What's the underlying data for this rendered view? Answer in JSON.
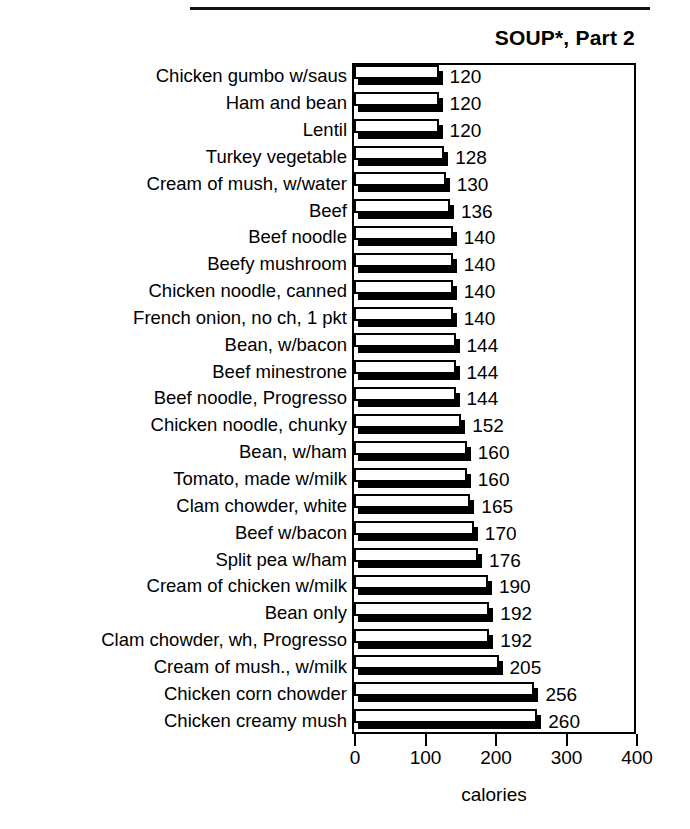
{
  "decorations": {
    "top_rule": "horizontal-rule"
  },
  "chart_data": {
    "type": "bar",
    "orientation": "horizontal",
    "title": "SOUP*, Part 2",
    "xlabel": "calories",
    "ylabel": "",
    "xlim": [
      0,
      400
    ],
    "xticks": [
      0,
      100,
      200,
      300,
      400
    ],
    "xtick_labels": [
      "0",
      "100",
      "200",
      "300",
      "400"
    ],
    "grid": false,
    "legend": null,
    "bar_style": "3d-shadow-white-face",
    "categories": [
      "Chicken gumbo w/saus",
      "Ham and bean",
      "Lentil",
      "Turkey vegetable",
      "Cream of mush, w/water",
      "Beef",
      "Beef noodle",
      "Beefy mushroom",
      "Chicken noodle, canned",
      "French onion, no ch, 1 pkt",
      "Bean, w/bacon",
      "Beef minestrone",
      "Beef noodle, Progresso",
      "Chicken noodle, chunky",
      "Bean, w/ham",
      "Tomato, made w/milk",
      "Clam chowder, white",
      "Beef w/bacon",
      "Split pea w/ham",
      "Cream of chicken w/milk",
      "Bean only",
      "Clam chowder, wh, Progresso",
      "Cream of mush., w/milk",
      "Chicken corn chowder",
      "Chicken creamy mush"
    ],
    "values": [
      120,
      120,
      120,
      128,
      130,
      136,
      140,
      140,
      140,
      140,
      144,
      144,
      144,
      152,
      160,
      160,
      165,
      170,
      176,
      190,
      192,
      192,
      205,
      256,
      260
    ],
    "value_labels": [
      "120",
      "120",
      "120",
      "128",
      "130",
      "136",
      "140",
      "140",
      "140",
      "140",
      "144",
      "144",
      "144",
      "152",
      "160",
      "160",
      "165",
      "170",
      "176",
      "190",
      "192",
      "192",
      "205",
      "256",
      "260"
    ]
  }
}
